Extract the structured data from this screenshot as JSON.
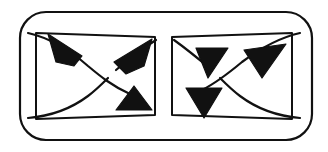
{
  "figure": {
    "title": "Braid-like strand diagram with arrowheads",
    "type": "line-art-diagram",
    "background_color": "#ffffff",
    "stroke_color": "#111111",
    "fill_color": "#111111",
    "canvas": {
      "width": 328,
      "height": 152
    },
    "outer_boundary": {
      "name": "rounded-rectangle",
      "x": 20,
      "y": 12,
      "width": 292,
      "height": 128,
      "corner_radius": 26,
      "stroke_width": 2.2
    },
    "inner_shapes": [
      {
        "name": "left-trapezoid",
        "points": "36,33 155,37 155,115 36,119",
        "stroke_width": 2.0
      },
      {
        "name": "right-trapezoid",
        "points": "172,37 292,33 292,119 172,115",
        "stroke_width": 2.0
      }
    ],
    "strands": [
      {
        "name": "left-upper-strand",
        "path": "M 28,33 C 50,38 72,52 88,66 C 100,76 112,86 130,94",
        "stroke_width": 2.2
      },
      {
        "name": "left-lower-strand-a",
        "path": "M 28,118 C 52,116 72,108 88,96 C 96,90 102,84 108,78",
        "stroke_width": 2.2
      },
      {
        "name": "left-lower-strand-b",
        "path": "M 116,70 C 128,60 140,50 156,40",
        "stroke_width": 2.2
      },
      {
        "name": "right-upper-strand",
        "path": "M 300,33 C 278,38 258,50 242,62 C 230,72 218,82 202,90",
        "stroke_width": 2.2
      },
      {
        "name": "right-lower-strand-a",
        "path": "M 300,118 C 276,116 256,108 240,96 C 232,90 226,84 220,78",
        "stroke_width": 2.2
      },
      {
        "name": "right-lower-strand-b",
        "path": "M 212,70 C 200,60 188,50 174,40",
        "stroke_width": 2.2
      }
    ],
    "arrowheads": [
      {
        "name": "arrow-left-top",
        "points": "48,34 82,56 74,66 56,62",
        "direction": "left",
        "stroke_width": 1.2
      },
      {
        "name": "arrow-left-mid-top",
        "points": "152,39 114,62 126,74 144,66",
        "direction": "left-down",
        "stroke_width": 1.2
      },
      {
        "name": "arrow-left-bottom",
        "points": "134,86 116,110 152,110",
        "direction": "up",
        "stroke_width": 1.2
      },
      {
        "name": "arrow-right-inner-top",
        "points": "196,48 228,48 208,78",
        "direction": "down",
        "stroke_width": 1.2
      },
      {
        "name": "arrow-right-outer-top",
        "points": "244,50 286,44 262,78",
        "direction": "down-left",
        "stroke_width": 1.2
      },
      {
        "name": "arrow-right-bottom",
        "points": "186,88 222,88 204,118",
        "direction": "down",
        "stroke_width": 1.2
      }
    ],
    "crossings": [
      {
        "name": "left-crossing",
        "x": 112,
        "y": 74,
        "type": "under-over-gap"
      },
      {
        "name": "right-crossing",
        "x": 216,
        "y": 74,
        "type": "under-over-gap"
      }
    ]
  }
}
